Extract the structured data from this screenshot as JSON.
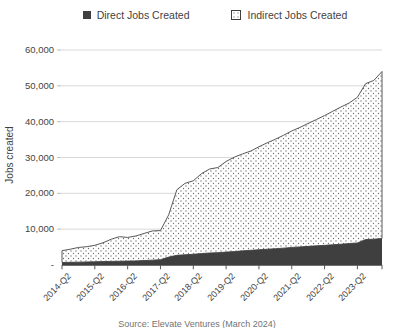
{
  "legend": {
    "direct_label": "Direct Jobs Created",
    "indirect_label": "Indirect Jobs Created"
  },
  "y_axis": {
    "title": "Jobs created",
    "tick_labels": [
      "60,000",
      "50,000",
      "40,000",
      "30,000",
      "20,000",
      "10,000",
      "-"
    ]
  },
  "x_axis": {
    "tick_labels": [
      "2014-Q2",
      "2015-Q2",
      "2016-Q2",
      "2017-Q2",
      "2018-Q2",
      "2019-Q2",
      "2020-Q2",
      "2021-Q2",
      "2022-Q2",
      "2023-Q2"
    ]
  },
  "caption": "Source: Elevate Ventures (March 2024)",
  "colors": {
    "direct_fill": "#3f3f3f",
    "outline": "#595959",
    "gridline": "#d9d9d9",
    "axis": "#404040",
    "tick": "#595959",
    "minor_tick": "#bfbfbf",
    "pattern_dot": "#6e6e6e",
    "text": "#444444"
  },
  "chart_data": {
    "type": "area",
    "stacked": true,
    "title": "",
    "xlabel": "",
    "ylabel": "Jobs created",
    "ylim": [
      0,
      60000
    ],
    "y_gridlines": [
      10000,
      20000,
      30000,
      40000,
      50000,
      60000
    ],
    "grid": true,
    "legend_position": "top",
    "x": [
      "2014-Q2",
      "2014-Q3",
      "2014-Q4",
      "2015-Q1",
      "2015-Q2",
      "2015-Q3",
      "2015-Q4",
      "2016-Q1",
      "2016-Q2",
      "2016-Q3",
      "2016-Q4",
      "2017-Q1",
      "2017-Q2",
      "2017-Q3",
      "2017-Q4",
      "2018-Q1",
      "2018-Q2",
      "2018-Q3",
      "2018-Q4",
      "2019-Q1",
      "2019-Q2",
      "2019-Q3",
      "2019-Q4",
      "2020-Q1",
      "2020-Q2",
      "2020-Q3",
      "2020-Q4",
      "2021-Q1",
      "2021-Q2",
      "2021-Q3",
      "2021-Q4",
      "2022-Q1",
      "2022-Q2",
      "2022-Q3",
      "2022-Q4",
      "2023-Q1",
      "2023-Q2",
      "2023-Q3",
      "2023-Q4",
      "2024-Q1"
    ],
    "series": [
      {
        "name": "Direct Jobs Created",
        "values": [
          700,
          750,
          800,
          850,
          900,
          950,
          1000,
          1050,
          1100,
          1150,
          1250,
          1350,
          1500,
          2200,
          2700,
          2850,
          3000,
          3200,
          3350,
          3450,
          3600,
          3750,
          3950,
          4100,
          4260,
          4400,
          4550,
          4700,
          4900,
          5050,
          5200,
          5350,
          5480,
          5650,
          5800,
          6000,
          6160,
          7100,
          7200,
          7400
        ]
      },
      {
        "name": "Indirect Jobs Created",
        "values": [
          3300,
          3650,
          4100,
          4250,
          4600,
          5250,
          6200,
          6850,
          6600,
          6950,
          7550,
          8150,
          8100,
          11800,
          18300,
          19950,
          20500,
          22300,
          23450,
          23750,
          25300,
          26350,
          27050,
          27700,
          28740,
          29700,
          30550,
          31500,
          32500,
          33350,
          34300,
          35250,
          36220,
          37250,
          38300,
          39200,
          40640,
          43500,
          44300,
          46600
        ]
      }
    ]
  }
}
